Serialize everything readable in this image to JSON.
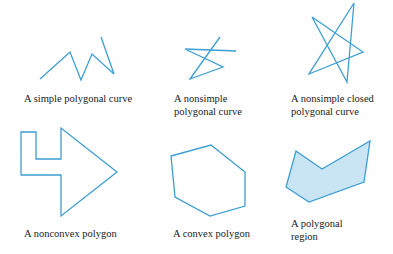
{
  "colors": {
    "stroke": "#3d9fd3",
    "region_fill": "#c9e4f3",
    "text": "#222222"
  },
  "figures": [
    {
      "id": "simple-polygonal-curve",
      "caption_lines": [
        "A simple polygonal curve"
      ],
      "kind": "polyline",
      "points": "40,79 70,52 81,80 92,54 114,74 101,37"
    },
    {
      "id": "nonsimple-polygonal-curve",
      "caption_lines": [
        "A nonsimple",
        "polygonal curve"
      ],
      "kind": "polyline",
      "points": "220,37 190,79 223,67 185,49 236,51"
    },
    {
      "id": "nonsimple-closed-polygonal-curve",
      "caption_lines": [
        "A nonsimple closed",
        "polygonal curve"
      ],
      "kind": "polygon",
      "points": "354,3 347,82 312,17 363,52 309,74"
    },
    {
      "id": "nonconvex-polygon",
      "caption_lines": [
        "A nonconvex polygon"
      ],
      "kind": "polygon",
      "points": "21,132 36,132 36,159 61,159 61,128 117,172 61,216 61,175 21,175"
    },
    {
      "id": "convex-polygon",
      "caption_lines": [
        "A convex polygon"
      ],
      "kind": "polygon",
      "points": "171,156 211,145 245,172 245,206 210,216 175,197"
    },
    {
      "id": "polygonal-region",
      "caption_lines": [
        "A polygonal",
        "region"
      ],
      "kind": "region",
      "points": "296,151 322,169 370,141 364,182 309,202 286,187"
    }
  ]
}
